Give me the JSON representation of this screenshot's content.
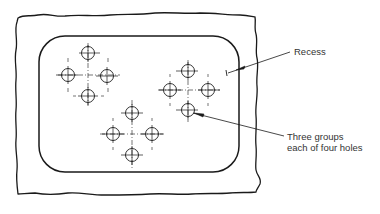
{
  "diagram": {
    "type": "engineering drawing",
    "labels": {
      "recess": "Recess",
      "holes_line1": "Three groups",
      "holes_line2": "each of four holes"
    },
    "colors": {
      "line": "#1a1a1a",
      "text": "#333333",
      "background": "#ffffff"
    },
    "hole_groups": [
      {
        "name": "group-1",
        "center": [
          88,
          75
        ],
        "holes": [
          [
            88,
            53
          ],
          [
            68,
            75
          ],
          [
            108,
            75
          ],
          [
            88,
            96
          ]
        ]
      },
      {
        "name": "group-2",
        "center": [
          188,
          90
        ],
        "holes": [
          [
            188,
            71
          ],
          [
            170,
            90
          ],
          [
            208,
            90
          ],
          [
            188,
            110
          ]
        ]
      },
      {
        "name": "group-3",
        "center": [
          132,
          134
        ],
        "holes": [
          [
            132,
            113
          ],
          [
            113,
            134
          ],
          [
            152,
            134
          ],
          [
            132,
            155
          ]
        ]
      }
    ]
  }
}
